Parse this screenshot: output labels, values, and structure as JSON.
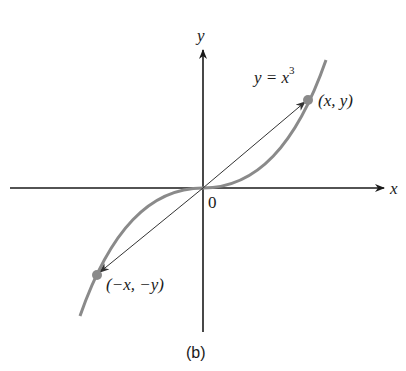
{
  "figure": {
    "caption": "(b)",
    "equation": {
      "lhs": "y = x",
      "exponent": "3"
    },
    "axes": {
      "x_label": "x",
      "y_label": "y",
      "origin_label": "0"
    },
    "points": [
      {
        "label": "(x, y)",
        "position": "first-quadrant"
      },
      {
        "label": "(−x, −y)",
        "position": "third-quadrant"
      }
    ],
    "colors": {
      "curve": "#8a8a8a",
      "axes": "#1a1a1a",
      "point": "#8a8a8a"
    }
  }
}
